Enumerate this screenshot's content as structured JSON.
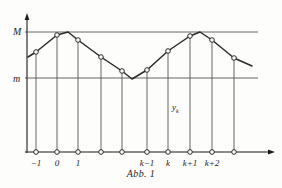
{
  "figure": {
    "caption": "Abb. 1",
    "series_label_base": "y",
    "series_label_sub": "k",
    "level_labels": {
      "upper": "M",
      "lower": "m"
    },
    "colors": {
      "ink": "#1c1c1c",
      "curve": "#2a2a2a",
      "guide": "#555555",
      "background": "#fdfdfc"
    }
  },
  "chart_data": {
    "type": "line",
    "title": "Abb. 1",
    "xlabel": "",
    "ylabel": "",
    "grid": false,
    "legend_position": "inline",
    "annotations": [
      {
        "text": "M",
        "kind": "level-line",
        "y": 32,
        "note": "upper bound line"
      },
      {
        "text": "m",
        "kind": "level-line",
        "y": 78,
        "note": "lower bound line"
      },
      {
        "text": "y_k",
        "kind": "series-label",
        "x": 172,
        "y": 103
      }
    ],
    "axis": {
      "x_arrow": true,
      "y_arrow": true,
      "x_axis_y_px": 152,
      "y_axis_x_px": 27,
      "x_range_px": [
        25,
        270
      ],
      "y_range_px": [
        18,
        153
      ]
    },
    "tick_labels": [
      "",
      "−1",
      "0",
      "1",
      "",
      "",
      "k−1",
      "k",
      "k+1",
      "k+2",
      ""
    ],
    "tick_x_px": [
      27,
      36,
      57,
      78,
      101,
      122,
      147,
      168,
      190,
      212,
      234
    ],
    "axis_markers_x_px": [
      36,
      57,
      78,
      101,
      122,
      147,
      168,
      190,
      212,
      234
    ],
    "labeled_ticks": [
      {
        "label": "−1",
        "x": 36
      },
      {
        "label": "0",
        "x": 57
      },
      {
        "label": "1",
        "x": 78
      },
      {
        "label": "k−1",
        "x": 147
      },
      {
        "label": "k",
        "x": 168
      },
      {
        "label": "k+1",
        "x": 190
      },
      {
        "label": "k+2",
        "x": 212
      }
    ],
    "points": [
      {
        "x": 36,
        "y": 52,
        "marker": true,
        "dropline": true
      },
      {
        "x": 57,
        "y": 35,
        "marker": true,
        "dropline": true
      },
      {
        "x": 78,
        "y": 40,
        "marker": true,
        "dropline": true
      },
      {
        "x": 101,
        "y": 57,
        "marker": true,
        "dropline": true
      },
      {
        "x": 122,
        "y": 71,
        "marker": true,
        "dropline": true
      },
      {
        "x": 147,
        "y": 70,
        "marker": true,
        "dropline": true
      },
      {
        "x": 168,
        "y": 51,
        "marker": true,
        "dropline": true
      },
      {
        "x": 190,
        "y": 36,
        "marker": true,
        "dropline": true
      },
      {
        "x": 212,
        "y": 40,
        "marker": true,
        "dropline": true
      },
      {
        "x": 234,
        "y": 58,
        "marker": true,
        "dropline": true
      }
    ],
    "polyline_px": [
      [
        28,
        57
      ],
      [
        36,
        52
      ],
      [
        57,
        35
      ],
      [
        68,
        32
      ],
      [
        78,
        40
      ],
      [
        101,
        57
      ],
      [
        122,
        71
      ],
      [
        132,
        79
      ],
      [
        147,
        70
      ],
      [
        168,
        51
      ],
      [
        190,
        36
      ],
      [
        200,
        32
      ],
      [
        212,
        40
      ],
      [
        234,
        58
      ],
      [
        252,
        66
      ]
    ],
    "level_lines_px": [
      {
        "label": "M",
        "y": 32,
        "x_from": 25,
        "x_to": 258
      },
      {
        "label": "m",
        "y": 78,
        "x_from": 25,
        "x_to": 258
      }
    ]
  }
}
